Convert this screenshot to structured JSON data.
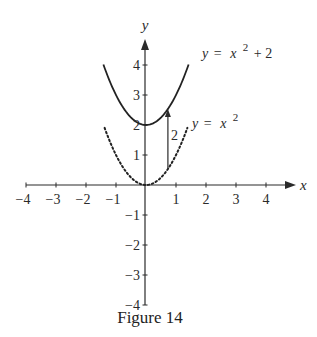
{
  "chart_data": {
    "type": "line",
    "title": "",
    "caption": "Figure 14",
    "xlabel": "x",
    "ylabel": "y",
    "xlim": [
      -4,
      4
    ],
    "ylim": [
      -4,
      4
    ],
    "grid": false,
    "x_ticks": [
      -4,
      -3,
      -2,
      -1,
      1,
      2,
      3,
      4
    ],
    "x_tick_labels": [
      "−4",
      "−3",
      "−2",
      "−1",
      "1",
      "2",
      "3",
      "4"
    ],
    "y_ticks": [
      -4,
      -3,
      -2,
      -1,
      1,
      2,
      3,
      4
    ],
    "y_tick_labels": [
      "−4",
      "−3",
      "−2",
      "−1",
      "1",
      "2",
      "3",
      "4"
    ],
    "series": [
      {
        "name": "y = x^2 + 2",
        "style": "solid",
        "function": "x^2 + 2",
        "x_range": [
          -1.42,
          1.42
        ],
        "x": [
          -1.4,
          -1.0,
          -0.5,
          0,
          0.5,
          1.0,
          1.4
        ],
        "values": [
          3.96,
          3.0,
          2.25,
          2.0,
          2.25,
          3.0,
          3.96
        ]
      },
      {
        "name": "y = x^2",
        "style": "dotted",
        "function": "x^2",
        "x_range": [
          -1.38,
          1.38
        ],
        "x": [
          -1.38,
          -1.0,
          -0.5,
          0,
          0.5,
          1.0,
          1.38
        ],
        "values": [
          1.9,
          1.0,
          0.25,
          0.0,
          0.25,
          1.0,
          1.9
        ]
      }
    ],
    "annotations": [
      {
        "type": "arrow",
        "x": 0.73,
        "from_y": 0.53,
        "to_y": 2.53,
        "label": "2"
      },
      {
        "type": "text",
        "text": "y = x² + 2",
        "near_series": "y = x^2 + 2"
      },
      {
        "type": "text",
        "text": "y = x²",
        "near_series": "y = x^2"
      }
    ]
  },
  "labels": {
    "eq_upper": {
      "y": "y",
      "eq": "=",
      "x": "x",
      "exp": "2",
      "rest": "+ 2"
    },
    "eq_lower": {
      "y": "y",
      "eq": "=",
      "x": "x",
      "exp": "2"
    },
    "shift_label": "2",
    "x_axis_name": "x",
    "y_axis_name": "y",
    "caption": "Figure 14"
  }
}
